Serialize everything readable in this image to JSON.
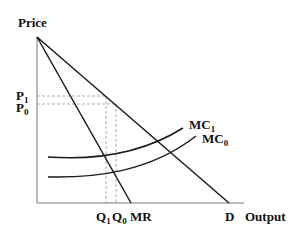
{
  "diagram": {
    "type": "economics-supply-demand",
    "axes": {
      "y_label": "Price",
      "x_label": "Output"
    },
    "curves": {
      "demand": "D",
      "marginal_revenue": "MR",
      "marginal_cost_1": "MC",
      "marginal_cost_1_sub": "1",
      "marginal_cost_0": "MC",
      "marginal_cost_0_sub": "0"
    },
    "price_levels": {
      "p1": "P",
      "p1_sub": "1",
      "p0": "P",
      "p0_sub": "0"
    },
    "quantity_levels": {
      "q1": "Q",
      "q1_sub": "1",
      "q0": "Q",
      "q0_sub": "0"
    },
    "colors": {
      "line": "#1a1a1a",
      "axis": "#555555",
      "dashed": "#999999"
    }
  }
}
